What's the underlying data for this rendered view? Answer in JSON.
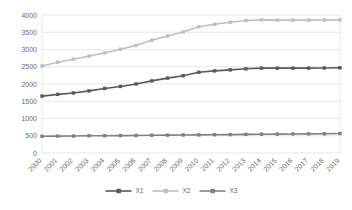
{
  "chart_data": {
    "type": "line",
    "title": "",
    "xlabel": "",
    "ylabel": "",
    "ylim": [
      0,
      4000
    ],
    "ytick_step": 500,
    "grid": true,
    "legend_position": "bottom-center",
    "categories": [
      "2000",
      "2001",
      "2002",
      "2003",
      "2004",
      "2005",
      "2006",
      "2007",
      "2008",
      "2009",
      "2010",
      "2011",
      "2012",
      "2013",
      "2014",
      "2015",
      "2016",
      "2017",
      "2018",
      "2019"
    ],
    "yticks": [
      "0",
      "500",
      "1000",
      "1500",
      "2000",
      "2500",
      "3000",
      "3500",
      "4000"
    ],
    "series": [
      {
        "name": "X1",
        "color": "#595959",
        "marker": "square",
        "values": [
          1650,
          1700,
          1740,
          1800,
          1870,
          1930,
          2000,
          2090,
          2170,
          2240,
          2340,
          2380,
          2410,
          2440,
          2460,
          2460,
          2460,
          2460,
          2465,
          2470
        ]
      },
      {
        "name": "X2",
        "color": "#bfbfbf",
        "marker": "square",
        "values": [
          2520,
          2630,
          2720,
          2810,
          2900,
          3010,
          3120,
          3270,
          3390,
          3510,
          3660,
          3730,
          3790,
          3840,
          3860,
          3850,
          3850,
          3850,
          3855,
          3860
        ]
      },
      {
        "name": "X3",
        "color": "#808080",
        "marker": "square",
        "values": [
          485,
          490,
          492,
          500,
          500,
          505,
          508,
          515,
          518,
          522,
          525,
          530,
          532,
          540,
          545,
          548,
          552,
          555,
          558,
          565
        ]
      }
    ]
  },
  "legend": {
    "items": [
      {
        "label": "X1",
        "color": "#595959"
      },
      {
        "label": "X2",
        "color": "#bfbfbf"
      },
      {
        "label": "X3",
        "color": "#808080"
      }
    ]
  },
  "colors": {
    "gridline": "#d9d9d9",
    "tick_text": "#6b6b6b",
    "background": "#ffffff"
  }
}
